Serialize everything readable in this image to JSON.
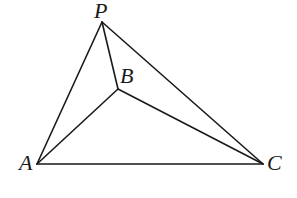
{
  "diagram": {
    "type": "geometry",
    "points": {
      "P": {
        "label": "P",
        "x": 102,
        "y": 22,
        "label_x": 94,
        "label_y": 18
      },
      "B": {
        "label": "B",
        "x": 118,
        "y": 89,
        "label_x": 120,
        "label_y": 83
      },
      "A": {
        "label": "A",
        "x": 37,
        "y": 164,
        "label_x": 19,
        "label_y": 170
      },
      "C": {
        "label": "C",
        "x": 263,
        "y": 164,
        "label_x": 267,
        "label_y": 170
      }
    },
    "edges": [
      [
        "P",
        "A"
      ],
      [
        "P",
        "B"
      ],
      [
        "P",
        "C"
      ],
      [
        "A",
        "B"
      ],
      [
        "B",
        "C"
      ],
      [
        "A",
        "C"
      ]
    ],
    "colors": {
      "stroke": "#1a1a1a",
      "background": "#ffffff"
    }
  }
}
